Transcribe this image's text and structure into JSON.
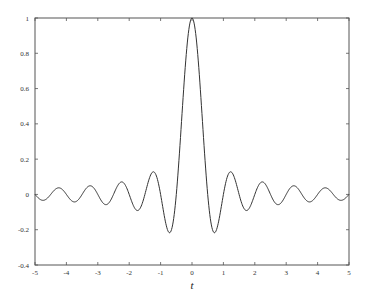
{
  "chart_data": {
    "type": "line",
    "title": "",
    "xlabel": "t",
    "ylabel": "",
    "xlim": [
      -5,
      5
    ],
    "ylim": [
      -0.4,
      1
    ],
    "grid": false,
    "legend": null,
    "x_ticks": [
      "-5",
      "-4",
      "-3",
      "-2",
      "-1",
      "0",
      "1",
      "2",
      "3",
      "4",
      "5"
    ],
    "y_ticks": [
      "-0.4",
      "-0.2",
      "0",
      "0.2",
      "0.4",
      "0.6",
      "0.8",
      "1"
    ],
    "series": [
      {
        "name": "sin(2πt)/(2πt)",
        "x": [
          -5,
          -4.75,
          -4.5,
          -4.25,
          -4,
          -3.75,
          -3.5,
          -3.25,
          -3,
          -2.75,
          -2.5,
          -2.25,
          -2,
          -1.75,
          -1.5,
          -1.25,
          -1,
          -0.75,
          -0.5,
          -0.25,
          0,
          0.25,
          0.5,
          0.75,
          1,
          1.25,
          1.5,
          1.75,
          2,
          2.25,
          2.5,
          2.75,
          3,
          3.25,
          3.5,
          3.75,
          4,
          4.25,
          4.5,
          4.75,
          5
        ],
        "y": [
          0,
          -0.034,
          0,
          0.037,
          0,
          -0.042,
          0,
          0.049,
          0,
          -0.058,
          0,
          0.071,
          0,
          -0.091,
          0,
          0.127,
          0,
          -0.212,
          0,
          0.637,
          1,
          0.637,
          0,
          -0.212,
          0,
          0.127,
          0,
          -0.091,
          0,
          0.071,
          0,
          -0.058,
          0,
          0.049,
          0,
          -0.042,
          0,
          0.037,
          0,
          -0.034,
          0
        ],
        "color": "#333333"
      }
    ]
  }
}
